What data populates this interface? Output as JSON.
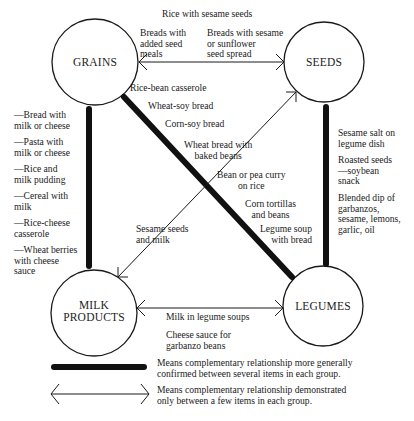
{
  "nodes": {
    "grains": "GRAINS",
    "seeds": "SEEDS",
    "milk_line1": "MILK",
    "milk_line2": "PRODUCTS",
    "legumes": "LEGUMES"
  },
  "edges": {
    "grains_seeds_top": "Rice with sesame seeds",
    "grains_seeds_left": "Breads with\nadded seed\nmeals",
    "grains_seeds_right": "Breads with sesame\nor sunflower\nseed spread",
    "grains_legumes": [
      "Rice-bean casserole",
      "Wheat-soy bread",
      "Corn-soy bread",
      "Wheat bread with\nbaked beans",
      "Bean or pea curry\non rice",
      "Corn tortillas\nand beans",
      "Legume soup\nwith bread"
    ],
    "grains_milk": [
      "—Bread with\nmilk or cheese",
      "—Pasta with\nmilk or cheese",
      "—Rice and\nmilk pudding",
      "—Cereal with\nmilk",
      "—Rice-cheese\ncasserole",
      "—Wheat berries\nwith cheese\nsauce"
    ],
    "seeds_milk": "Sesame seeds\nand milk",
    "seeds_legumes": [
      "Sesame salt on\nlegume dish",
      "Roasted seeds\n—soybean\nsnack",
      "Blended dip of\ngarbanzos,\nsesame, lemons,\ngarlic, oil"
    ],
    "milk_legumes": [
      "Milk in legume soups",
      "Cheese sauce for\ngarbanzo beans"
    ]
  },
  "legend": {
    "thick_line": "Means complementary relationship more generally\nconfirmed between several items in each group.",
    "thin_arrow": "Means complementary relationship demonstrated\nonly between a few items in each group."
  },
  "caption_fragment": "",
  "colors": {
    "ink": "#1a1a1a",
    "background": "#ffffff"
  }
}
